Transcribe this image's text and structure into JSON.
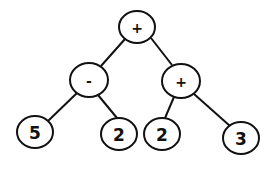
{
  "diagram": {
    "type": "expression-tree",
    "colors": {
      "stroke": "#111111",
      "fill": "#ffffff",
      "text": "#111111",
      "background": "#ffffff"
    },
    "nodes": [
      {
        "id": "root",
        "label": "+",
        "kind": "operator",
        "cx": 137,
        "cy": 27,
        "rx": 18,
        "ry": 16
      },
      {
        "id": "minus",
        "label": "-",
        "kind": "operator",
        "cx": 89,
        "cy": 80,
        "rx": 19,
        "ry": 17
      },
      {
        "id": "plus_right",
        "label": "+",
        "kind": "operator",
        "cx": 181,
        "cy": 81,
        "rx": 19,
        "ry": 17
      },
      {
        "id": "leaf_5",
        "label": "5",
        "kind": "operand",
        "cx": 35,
        "cy": 132,
        "rx": 18,
        "ry": 16
      },
      {
        "id": "leaf_2a",
        "label": "2",
        "kind": "operand",
        "cx": 119,
        "cy": 134,
        "rx": 18,
        "ry": 16
      },
      {
        "id": "leaf_2b",
        "label": "2",
        "kind": "operand",
        "cx": 162,
        "cy": 134,
        "rx": 18,
        "ry": 16
      },
      {
        "id": "leaf_3",
        "label": "3",
        "kind": "operand",
        "cx": 241,
        "cy": 138,
        "rx": 18,
        "ry": 16
      }
    ],
    "edges": [
      {
        "from": "root",
        "to": "minus",
        "x1": 125,
        "y1": 39,
        "x2": 101,
        "y2": 66
      },
      {
        "from": "root",
        "to": "plus_right",
        "x1": 151,
        "y1": 38,
        "x2": 172,
        "y2": 65
      },
      {
        "from": "minus",
        "to": "leaf_5",
        "x1": 77,
        "y1": 93,
        "x2": 48,
        "y2": 121
      },
      {
        "from": "minus",
        "to": "leaf_2a",
        "x1": 98,
        "y1": 95,
        "x2": 117,
        "y2": 118
      },
      {
        "from": "plus_right",
        "to": "leaf_2b",
        "x1": 174,
        "y1": 97,
        "x2": 165,
        "y2": 118
      },
      {
        "from": "plus_right",
        "to": "leaf_3",
        "x1": 194,
        "y1": 94,
        "x2": 230,
        "y2": 126
      }
    ]
  }
}
